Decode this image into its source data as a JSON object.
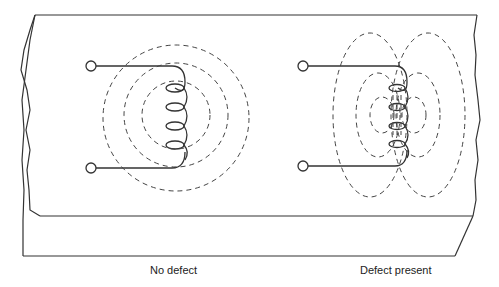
{
  "figure": {
    "panels": [
      {
        "label": "No defect",
        "field_pattern": "concentric-circles"
      },
      {
        "label": "Defect present",
        "field_pattern": "split-distorted-ellipses"
      }
    ]
  },
  "colors": {
    "line": "#333333",
    "dashed": "#444444",
    "background": "#ffffff"
  }
}
